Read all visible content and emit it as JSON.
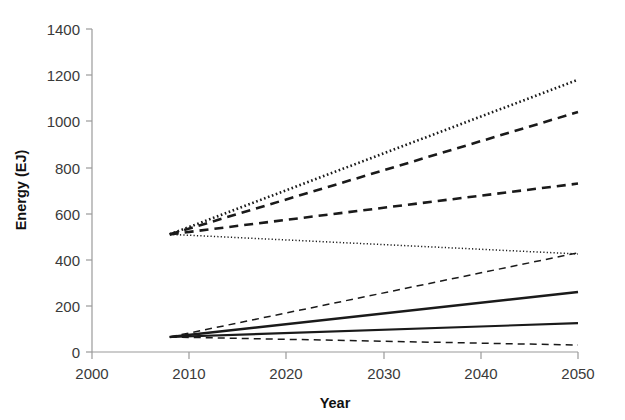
{
  "chart_data": {
    "type": "line",
    "title": "",
    "xlabel": "Year",
    "ylabel": "Energy (EJ)",
    "xlim": [
      2000,
      2050
    ],
    "ylim": [
      0,
      1400
    ],
    "xticks": [
      2000,
      2010,
      2020,
      2030,
      2040,
      2050
    ],
    "xtick_labels": [
      "2000",
      "2010",
      "2020",
      "2030",
      "2040",
      "2050"
    ],
    "yticks": [
      0,
      200,
      400,
      600,
      800,
      1000,
      1200,
      1400
    ],
    "ytick_labels": [
      "0",
      "200",
      "400",
      "600",
      "800",
      "1000",
      "1200",
      "1400"
    ],
    "grid": false,
    "legend": "none",
    "x": [
      2008,
      2050
    ],
    "series": [
      {
        "name": "primary-energy-high-dotted",
        "style": "dotted",
        "width": "thick",
        "color": "#1a1a1a",
        "values": [
          510,
          1180
        ]
      },
      {
        "name": "primary-energy-high-dashed",
        "style": "dashed",
        "width": "thick",
        "color": "#1a1a1a",
        "values": [
          510,
          1040
        ]
      },
      {
        "name": "primary-energy-mid-dashed",
        "style": "dashed",
        "width": "thick",
        "color": "#1a1a1a",
        "values": [
          510,
          730
        ]
      },
      {
        "name": "primary-energy-low-dotted",
        "style": "dotted",
        "width": "thin",
        "color": "#1a1a1a",
        "values": [
          510,
          425
        ]
      },
      {
        "name": "renewable-high-dashed",
        "style": "dashed",
        "width": "thin",
        "color": "#1a1a1a",
        "values": [
          65,
          430
        ]
      },
      {
        "name": "renewable-mid-solid",
        "style": "solid",
        "width": "thick",
        "color": "#1a1a1a",
        "values": [
          65,
          260
        ]
      },
      {
        "name": "renewable-low-solid",
        "style": "solid",
        "width": "medium",
        "color": "#1a1a1a",
        "values": [
          65,
          125
        ]
      },
      {
        "name": "renewable-lowest-dashed",
        "style": "dashed",
        "width": "thin",
        "color": "#1a1a1a",
        "values": [
          65,
          30
        ]
      }
    ]
  },
  "colors": {
    "axis": "#9a9a9a",
    "text": "#3a3a3a",
    "line": "#1a1a1a",
    "background": "#ffffff"
  }
}
